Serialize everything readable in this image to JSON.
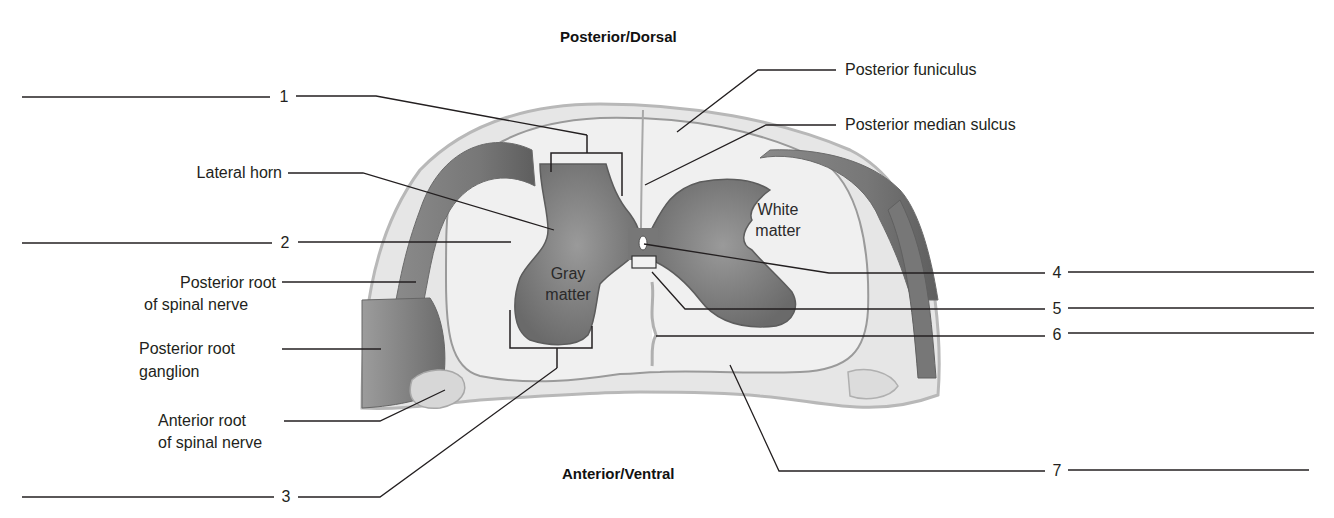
{
  "orientation": {
    "top": "Posterior/Dorsal",
    "bottom": "Anterior/Ventral"
  },
  "labels_left": [
    {
      "id": "lateral-horn",
      "lines": [
        "Lateral horn"
      ]
    },
    {
      "id": "posterior-root-spinal-nerve",
      "lines": [
        "Posterior root",
        "of spinal nerve"
      ]
    },
    {
      "id": "posterior-root-ganglion",
      "lines": [
        "Posterior  root",
        "ganglion"
      ]
    },
    {
      "id": "anterior-root-spinal-nerve",
      "lines": [
        "Anterior root",
        "of spinal nerve"
      ]
    }
  ],
  "labels_right": [
    {
      "id": "posterior-funiculus",
      "text": "Posterior funiculus"
    },
    {
      "id": "posterior-median-sulcus",
      "text": "Posterior median sulcus"
    }
  ],
  "inner_labels": {
    "gray_matter": [
      "Gray",
      "matter"
    ],
    "white_matter": [
      "White",
      "matter"
    ]
  },
  "blanks": [
    {
      "number": "1",
      "side": "left",
      "answer": ""
    },
    {
      "number": "2",
      "side": "left",
      "answer": ""
    },
    {
      "number": "3",
      "side": "left",
      "answer": ""
    },
    {
      "number": "4",
      "side": "right",
      "answer": ""
    },
    {
      "number": "5",
      "side": "right",
      "answer": ""
    },
    {
      "number": "6",
      "side": "right",
      "answer": ""
    },
    {
      "number": "7",
      "side": "right",
      "answer": ""
    }
  ],
  "colors": {
    "gray_matter": "#7d7d7d",
    "white_matter": "#ececec",
    "meninges": "#d4d4d4",
    "leader_line": "#231f20"
  }
}
